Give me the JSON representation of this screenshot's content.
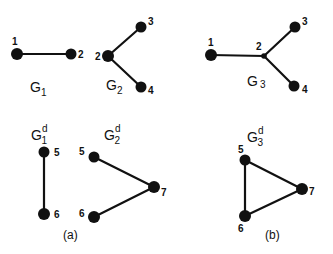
{
  "graphs": {
    "g1": {
      "name": "G",
      "sub": "1",
      "sup": "",
      "nodes": [
        {
          "id": "1",
          "label": "1"
        },
        {
          "id": "2",
          "label": "2"
        }
      ],
      "edges": [
        [
          "1",
          "2"
        ]
      ]
    },
    "g2": {
      "name": "G",
      "sub": "2",
      "sup": "",
      "nodes": [
        {
          "id": "2",
          "label": "2"
        },
        {
          "id": "3",
          "label": "3"
        },
        {
          "id": "4",
          "label": "4"
        }
      ],
      "edges": [
        [
          "2",
          "3"
        ],
        [
          "2",
          "4"
        ]
      ]
    },
    "g3": {
      "name": "G",
      "sub": "3",
      "sup": "",
      "nodes": [
        {
          "id": "1",
          "label": "1"
        },
        {
          "id": "2",
          "label": "2"
        },
        {
          "id": "3",
          "label": "3"
        },
        {
          "id": "4",
          "label": "4"
        }
      ],
      "edges": [
        [
          "1",
          "2"
        ],
        [
          "2",
          "3"
        ],
        [
          "2",
          "4"
        ]
      ]
    },
    "g1d": {
      "name": "G",
      "sub": "1",
      "sup": "d",
      "nodes": [
        {
          "id": "5",
          "label": "5"
        },
        {
          "id": "6",
          "label": "6"
        }
      ],
      "edges": [
        [
          "5",
          "6"
        ]
      ]
    },
    "g2d": {
      "name": "G",
      "sub": "2",
      "sup": "d",
      "nodes": [
        {
          "id": "5",
          "label": "5"
        },
        {
          "id": "6",
          "label": "6"
        },
        {
          "id": "7",
          "label": "7"
        }
      ],
      "edges": [
        [
          "5",
          "7"
        ],
        [
          "6",
          "7"
        ]
      ]
    },
    "g3d": {
      "name": "G",
      "sub": "3",
      "sup": "d",
      "nodes": [
        {
          "id": "5",
          "label": "5"
        },
        {
          "id": "6",
          "label": "6"
        },
        {
          "id": "7",
          "label": "7"
        }
      ],
      "edges": [
        [
          "5",
          "7"
        ],
        [
          "6",
          "7"
        ],
        [
          "5",
          "6"
        ]
      ]
    }
  },
  "captions": {
    "a": "(a)",
    "b": "(b)"
  }
}
